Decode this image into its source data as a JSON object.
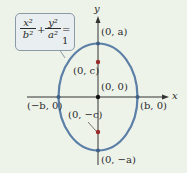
{
  "equation": {
    "term1_num": "x²",
    "term1_den": "b²",
    "plus": "+",
    "term2_num": "y²",
    "term2_den": "a²",
    "equals": "= 1"
  },
  "axes": {
    "x_label": "x",
    "y_label": "y"
  },
  "points": {
    "top_vertex": "(0, a)",
    "bottom_vertex": "(0, −a)",
    "left_vertex": "(−b, 0)",
    "right_vertex": "(b, 0)",
    "focus_upper": "(0, c)",
    "focus_lower": "(0, −c)",
    "center": "(0, 0)"
  },
  "colors": {
    "ellipse": "#5b7fa6",
    "focus": "#9b2a2a",
    "axis": "#333333",
    "background": "#eef3ea"
  }
}
